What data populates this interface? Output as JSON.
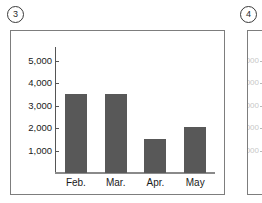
{
  "figures": {
    "current": {
      "number": "3",
      "badge_label": "③"
    },
    "next": {
      "number": "4",
      "badge_label": "④"
    }
  },
  "panel_next": {
    "ghost_labels": [
      "5,000",
      "4,000",
      "3,000",
      "2,000",
      "1,000"
    ]
  },
  "colors": {
    "bar_fill": "#585858",
    "axis": "#555555",
    "panel_border": "#7d7d7d",
    "background": "#ffffff"
  },
  "chart_data": {
    "type": "bar",
    "title": "",
    "subtitle": "",
    "xlabel": "",
    "ylabel": "",
    "categories": [
      "Feb.",
      "Mar.",
      "Apr.",
      "May"
    ],
    "values": [
      3500,
      3500,
      1500,
      2050
    ],
    "series": [
      {
        "name": "",
        "values": [
          3500,
          3500,
          1500,
          2050
        ]
      }
    ],
    "ylim": [
      0,
      5600
    ],
    "yticks": [
      1000,
      2000,
      3000,
      4000,
      5000
    ],
    "ytick_labels": [
      "1,000",
      "2,000",
      "3,000",
      "4,000",
      "5,000"
    ],
    "grid": false,
    "legend": "none",
    "legend_position": "none"
  }
}
